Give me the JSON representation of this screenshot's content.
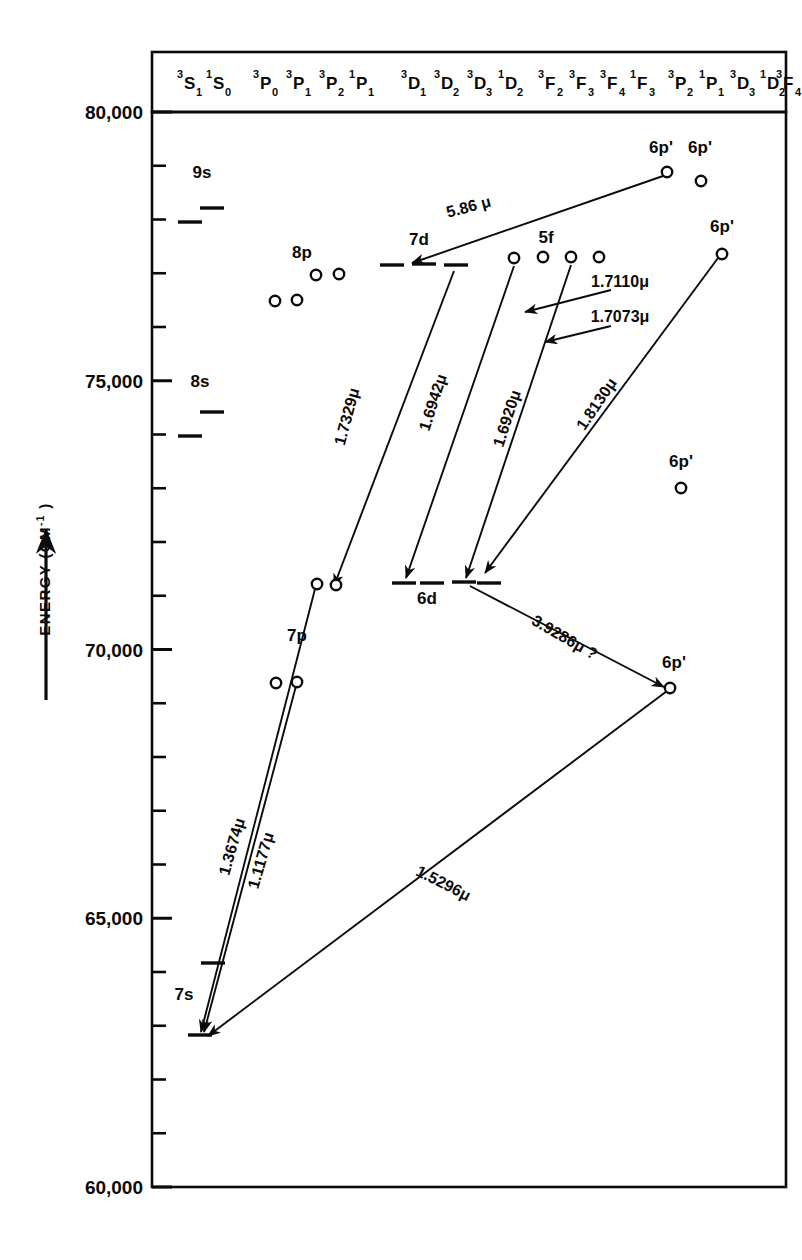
{
  "figure": {
    "axis_label": "ENERGY (CM",
    "axis_label_sup": "-1",
    "axis_label_tail": " )",
    "axis_arrow": "up-arrow"
  },
  "chart_data": {
    "type": "scatter",
    "title": "",
    "xlabel": "",
    "ylabel": "ENERGY (CM-1)",
    "ylim": [
      60000,
      80000
    ],
    "grid": false,
    "legend": "none",
    "y_ticks_major": [
      "80,000",
      "75,000",
      "70,000",
      "65,000",
      "60,000"
    ],
    "y_tick_values": [
      80000,
      75000,
      70000,
      65000,
      60000
    ],
    "y_minor_step": 1000,
    "term_columns": [
      {
        "label": "3S1",
        "pre": "3",
        "base": "S",
        "sub": "1",
        "x": 186
      },
      {
        "label": "1S0",
        "pre": "1",
        "base": "S",
        "sub": "0",
        "x": 215
      },
      {
        "label": "3P0",
        "pre": "3",
        "base": "P",
        "sub": "0",
        "x": 262
      },
      {
        "label": "3P1",
        "pre": "3",
        "base": "P",
        "sub": "1",
        "x": 295
      },
      {
        "label": "3P2",
        "pre": "3",
        "base": "P",
        "sub": "2",
        "x": 328
      },
      {
        "label": "1P1",
        "pre": "1",
        "base": "P",
        "sub": "1",
        "x": 358
      },
      {
        "label": "3D1",
        "pre": "3",
        "base": "D",
        "sub": "1",
        "x": 410
      },
      {
        "label": "3D2",
        "pre": "3",
        "base": "D",
        "sub": "2",
        "x": 443
      },
      {
        "label": "3D3",
        "pre": "3",
        "base": "D",
        "sub": "3",
        "x": 476
      },
      {
        "label": "1D2",
        "pre": "1",
        "base": "D",
        "sub": "2",
        "x": 507
      },
      {
        "label": "3F2",
        "pre": "3",
        "base": "F",
        "sub": "2",
        "x": 547
      },
      {
        "label": "3F3",
        "pre": "3",
        "base": "F",
        "sub": "3",
        "x": 578
      },
      {
        "label": "3F4",
        "pre": "3",
        "base": "F",
        "sub": "4",
        "x": 609
      },
      {
        "label": "1F3",
        "pre": "1",
        "base": "F",
        "sub": "3",
        "x": 639
      },
      {
        "label": "3P2",
        "pre": "3",
        "base": "P",
        "sub": "2",
        "x": 677
      },
      {
        "label": "1P1",
        "pre": "1",
        "base": "P",
        "sub": "1",
        "x": 708
      },
      {
        "label": "3D3",
        "pre": "3",
        "base": "D",
        "sub": "3",
        "x": 739
      },
      {
        "label": "1D2",
        "pre": "1",
        "base": "D",
        "sub": "2",
        "x": 769
      },
      {
        "label": "3F4",
        "pre": "3",
        "base": "F",
        "sub": "4",
        "x": 785
      }
    ],
    "level_groups": [
      {
        "name": "9s",
        "label": "9s",
        "label_x": 202,
        "label_y": 178,
        "marker": "dash",
        "levels": [
          {
            "x": 212,
            "y": 208
          },
          {
            "x": 190,
            "y": 222
          }
        ]
      },
      {
        "name": "8s",
        "label": "8s",
        "label_x": 200,
        "label_y": 387,
        "marker": "dash",
        "levels": [
          {
            "x": 212,
            "y": 412
          },
          {
            "x": 190,
            "y": 436
          }
        ]
      },
      {
        "name": "8p",
        "label": "8p",
        "label_x": 302,
        "label_y": 258,
        "marker": "circle",
        "levels": [
          {
            "x": 316,
            "y": 275
          },
          {
            "x": 339,
            "y": 274
          },
          {
            "x": 275,
            "y": 301
          },
          {
            "x": 297,
            "y": 300
          }
        ]
      },
      {
        "name": "7p",
        "label": "7p",
        "label_x": 297,
        "label_y": 641,
        "marker": "circle",
        "levels": [
          {
            "x": 317,
            "y": 584
          },
          {
            "x": 336,
            "y": 585
          },
          {
            "x": 276,
            "y": 683
          },
          {
            "x": 297,
            "y": 682
          }
        ]
      },
      {
        "name": "7s",
        "label": "7s",
        "label_x": 184,
        "label_y": 1000,
        "marker": "dash",
        "levels": [
          {
            "x": 213,
            "y": 963
          },
          {
            "x": 200,
            "y": 1035
          }
        ]
      },
      {
        "name": "7d",
        "label": "7d",
        "label_x": 419,
        "label_y": 245,
        "marker": "dash",
        "levels": [
          {
            "x": 392,
            "y": 265
          },
          {
            "x": 424,
            "y": 264
          },
          {
            "x": 456,
            "y": 265
          }
        ]
      },
      {
        "name": "5f",
        "label": "5f",
        "label_x": 546,
        "label_y": 243,
        "marker": "circle",
        "levels": [
          {
            "x": 514,
            "y": 258
          },
          {
            "x": 543,
            "y": 257
          },
          {
            "x": 571,
            "y": 257
          },
          {
            "x": 599,
            "y": 257
          }
        ]
      },
      {
        "name": "6d",
        "label": "6d",
        "label_x": 427,
        "label_y": 604,
        "marker": "dash",
        "levels": [
          {
            "x": 404,
            "y": 583
          },
          {
            "x": 432,
            "y": 583
          },
          {
            "x": 464,
            "y": 582
          },
          {
            "x": 489,
            "y": 583
          }
        ]
      },
      {
        "name": "6p-prime-a",
        "label": "6p'",
        "label_x": 661,
        "label_y": 153,
        "marker": "circle",
        "levels": [
          {
            "x": 667,
            "y": 172
          }
        ]
      },
      {
        "name": "6p-prime-b",
        "label": "6p'",
        "label_x": 700,
        "label_y": 153,
        "marker": "circle",
        "levels": [
          {
            "x": 701,
            "y": 181
          }
        ]
      },
      {
        "name": "6p-prime-c",
        "label": "6p'",
        "label_x": 722,
        "label_y": 232,
        "marker": "circle",
        "levels": [
          {
            "x": 722,
            "y": 254
          }
        ]
      },
      {
        "name": "6p-prime-d",
        "label": "6p'",
        "label_x": 681,
        "label_y": 467,
        "marker": "circle",
        "levels": [
          {
            "x": 681,
            "y": 488
          }
        ]
      },
      {
        "name": "6p-prime-e",
        "label": "6p'",
        "label_x": 674,
        "label_y": 668,
        "marker": "circle",
        "levels": [
          {
            "x": 670,
            "y": 688
          }
        ]
      },
      {
        "name": "7p-upper",
        "label": "",
        "label_x": 0,
        "label_y": 0,
        "marker": "circle",
        "levels": []
      }
    ],
    "transitions": [
      {
        "name": "5.86",
        "label": "5.86 μ",
        "label_x": 470,
        "label_y": 212,
        "rot": -15,
        "x1": 663,
        "y1": 176,
        "x2": 412,
        "y2": 263
      },
      {
        "name": "1.7329",
        "label": "1.7329μ",
        "label_x": 352,
        "label_y": 418,
        "rot": -75,
        "x1": 454,
        "y1": 271,
        "x2": 334,
        "y2": 586
      },
      {
        "name": "1.6942",
        "label": "1.6942μ",
        "label_x": 438,
        "label_y": 404,
        "rot": -72,
        "x1": 514,
        "y1": 266,
        "x2": 406,
        "y2": 578
      },
      {
        "name": "1.6920",
        "label": "1.6920μ",
        "label_x": 512,
        "label_y": 420,
        "rot": -72,
        "x1": 571,
        "y1": 265,
        "x2": 466,
        "y2": 578
      },
      {
        "name": "1.7110",
        "label": "1.7110μ",
        "label_x": 620,
        "label_y": 287,
        "rot": 0,
        "x1": 611,
        "y1": 290,
        "x2": 525,
        "y2": 312
      },
      {
        "name": "1.7073",
        "label": "1.7073μ",
        "label_x": 620,
        "label_y": 322,
        "rot": 0,
        "x1": 611,
        "y1": 326,
        "x2": 545,
        "y2": 342
      },
      {
        "name": "1.8130",
        "label": "1.8130μ",
        "label_x": 601,
        "label_y": 407,
        "rot": -56,
        "x1": 718,
        "y1": 258,
        "x2": 485,
        "y2": 573
      },
      {
        "name": "3.9286",
        "label": "3.9286μ ?",
        "label_x": 562,
        "label_y": 642,
        "rot": 30,
        "x1": 470,
        "y1": 586,
        "x2": 664,
        "y2": 687
      },
      {
        "name": "1.3674",
        "label": "1.3674μ",
        "label_x": 237,
        "label_y": 848,
        "rot": -74,
        "x1": 315,
        "y1": 589,
        "x2": 201,
        "y2": 1032
      },
      {
        "name": "1.1177",
        "label": "1.1177μ",
        "label_x": 266,
        "label_y": 862,
        "rot": -74,
        "x1": 296,
        "y1": 686,
        "x2": 204,
        "y2": 1032
      },
      {
        "name": "1.5296",
        "label": "1.5296μ",
        "label_x": 441,
        "label_y": 888,
        "rot": 27,
        "x1": 667,
        "y1": 691,
        "x2": 208,
        "y2": 1036
      }
    ]
  }
}
